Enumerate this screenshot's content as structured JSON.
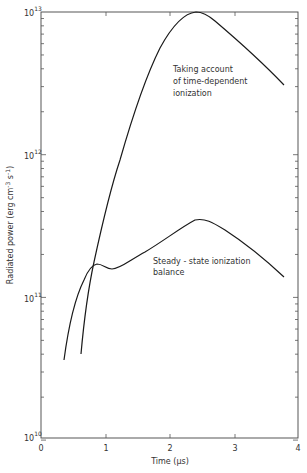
{
  "chart_data": {
    "type": "line",
    "title": "",
    "xlabel": "Time (µs)",
    "ylabel": "Radiated power (erg cm⁻³ s⁻¹)",
    "xlim": [
      0,
      4
    ],
    "ylim": [
      10000000000.0,
      10000000000000.0
    ],
    "yscale": "log",
    "x_ticks": [
      "0",
      "1",
      "2",
      "3",
      "4"
    ],
    "y_ticks": [
      "10^10",
      "10^11",
      "10^12",
      "10^13"
    ],
    "grid": false,
    "legend": "inline annotations",
    "series": [
      {
        "name": "Taking account of time-dependent ionization",
        "points": [
          [
            0.62,
            40000000000.0
          ],
          [
            0.75,
            100000000000.0
          ],
          [
            0.85,
            180000000000.0
          ],
          [
            1.0,
            350000000000.0
          ],
          [
            1.25,
            1000000000000.0
          ],
          [
            1.5,
            2600000000000.0
          ],
          [
            1.75,
            6000000000000.0
          ],
          [
            2.0,
            8800000000000.0
          ],
          [
            2.3,
            10000000000000.0
          ],
          [
            2.5,
            9600000000000.0
          ],
          [
            2.8,
            7200000000000.0
          ],
          [
            3.2,
            5000000000000.0
          ],
          [
            3.75,
            3100000000000.0
          ]
        ]
      },
      {
        "name": "Steady-state ionization balance",
        "points": [
          [
            0.35,
            36000000000.0
          ],
          [
            0.5,
            75000000000.0
          ],
          [
            0.65,
            140000000000.0
          ],
          [
            0.8,
            175000000000.0
          ],
          [
            0.9,
            175000000000.0
          ],
          [
            1.1,
            160000000000.0
          ],
          [
            1.4,
            190000000000.0
          ],
          [
            1.8,
            260000000000.0
          ],
          [
            2.2,
            330000000000.0
          ],
          [
            2.45,
            350000000000.0
          ],
          [
            2.8,
            290000000000.0
          ],
          [
            3.2,
            210000000000.0
          ],
          [
            3.75,
            140000000000.0
          ]
        ]
      }
    ],
    "annotations": [
      {
        "text": [
          "Taking account",
          "of time-dependent",
          "ionization"
        ]
      },
      {
        "text": [
          "Steady - state ionization",
          "balance"
        ]
      }
    ]
  },
  "axes": {
    "x_label": "Time (µs)",
    "y_label": "Radiated power (erg cm",
    "y_label_exp1": "-3",
    "y_label_mid": " s",
    "y_label_exp2": "-1",
    "y_label_end": ")",
    "x_ticks": [
      "0",
      "1",
      "2",
      "3",
      "4"
    ],
    "y_decades": [
      {
        "base": "10",
        "exp": "13"
      },
      {
        "base": "10",
        "exp": "12"
      },
      {
        "base": "10",
        "exp": "11"
      },
      {
        "base": "10",
        "exp": "10"
      }
    ]
  },
  "annotations": {
    "time_dependent": [
      "Taking account",
      "of time-dependent",
      "ionization"
    ],
    "steady_state": [
      "Steady - state ionization",
      "balance"
    ]
  }
}
